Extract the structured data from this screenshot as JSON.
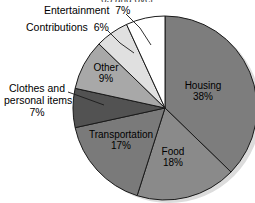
{
  "figure": {
    "title_fragment": "65 and over",
    "width": 255,
    "height": 203
  },
  "chart_data": {
    "type": "pie",
    "title": "65 and over",
    "xlabel": "",
    "ylabel": "",
    "legend": "none",
    "grid": false,
    "start_angle_deg": 0,
    "direction": "clockwise",
    "categories": [
      "Housing",
      "Food",
      "Transportation",
      "Clothes and personal items",
      "Other",
      "Contributions",
      "Entertainment"
    ],
    "values": [
      38,
      18,
      17,
      7,
      9,
      6,
      7
    ],
    "value_suffix": "%",
    "colors": [
      "#7d7d7d",
      "#8a8a8a",
      "#7a7a7a",
      "#525252",
      "#a8a8a8",
      "#e0e0e0",
      "#ffffff"
    ],
    "slices": [
      {
        "label": "Housing",
        "value": 38,
        "value_text": "38%",
        "color": "#7d7d7d",
        "label_placement": "inside",
        "leader_line": false
      },
      {
        "label": "Food",
        "value": 18,
        "value_text": "18%",
        "color": "#8a8a8a",
        "label_placement": "inside",
        "leader_line": false
      },
      {
        "label": "Transportation",
        "value": 17,
        "value_text": "17%",
        "color": "#7a7a7a",
        "label_placement": "inside",
        "leader_line": false
      },
      {
        "label": "Clothes and personal items",
        "value": 7,
        "value_text": "7%",
        "color": "#525252",
        "label_placement": "outside-left",
        "leader_line": true
      },
      {
        "label": "Other",
        "value": 9,
        "value_text": "9%",
        "color": "#a8a8a8",
        "label_placement": "inside",
        "leader_line": false
      },
      {
        "label": "Contributions",
        "value": 6,
        "value_text": "6%",
        "color": "#e0e0e0",
        "label_placement": "outside-top",
        "leader_line": true
      },
      {
        "label": "Entertainment",
        "value": 7,
        "value_text": "7%",
        "color": "#ffffff",
        "label_placement": "outside-top",
        "leader_line": true
      }
    ]
  },
  "labels": {
    "entertainment": {
      "name": "Entertainment",
      "pct": "7%"
    },
    "contributions": {
      "name": "Contributions",
      "pct": "6%"
    },
    "clothes_line1": "Clothes and",
    "clothes_line2": "personal items",
    "clothes_pct": "7%",
    "other_name": "Other",
    "other_pct": "9%",
    "housing_name": "Housing",
    "housing_pct": "38%",
    "food_name": "Food",
    "food_pct": "18%",
    "transportation_name": "Transportation",
    "transportation_pct": "17%"
  },
  "style": {
    "outline": "#1a1a1a",
    "shadow": "#d8d8d8",
    "text": "#000000"
  }
}
